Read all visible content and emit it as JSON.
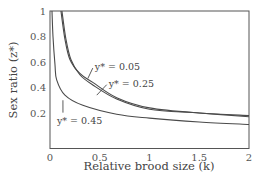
{
  "chart_data": {
    "type": "line",
    "title": "",
    "xlabel": "Relative brood size (k)",
    "ylabel": "Sex ratio (z*)",
    "xlim": [
      0,
      2
    ],
    "ylim": [
      0.07,
      1
    ],
    "xticks": [
      "0",
      "0.5",
      "1",
      "1.5",
      "2"
    ],
    "yticks": [
      "0.2",
      "0.4",
      "0.6",
      "0.8",
      "1"
    ],
    "grid": false,
    "legend": "inline annotations",
    "series": [
      {
        "name": "y* = 0.05",
        "x": [
          0.11,
          0.15,
          0.2,
          0.3,
          0.43,
          0.67,
          1.0,
          1.5,
          2.0
        ],
        "y": [
          1.0,
          0.78,
          0.62,
          0.51,
          0.44,
          0.32,
          0.24,
          0.2,
          0.18
        ]
      },
      {
        "name": "y* = 0.25",
        "x": [
          0.12,
          0.16,
          0.21,
          0.3,
          0.43,
          0.67,
          1.0,
          1.5,
          2.0
        ],
        "y": [
          1.0,
          0.78,
          0.62,
          0.5,
          0.42,
          0.31,
          0.23,
          0.2,
          0.17
        ]
      },
      {
        "name": "y* = 0.45",
        "x": [
          0.02,
          0.03,
          0.05,
          0.067,
          0.15,
          0.33,
          0.67,
          1.0,
          1.5,
          2.0
        ],
        "y": [
          1.0,
          0.8,
          0.58,
          0.46,
          0.34,
          0.26,
          0.19,
          0.16,
          0.13,
          0.11
        ]
      }
    ],
    "annotations": [
      {
        "text": "y* = 0.05",
        "x": 0.45,
        "y": 0.56,
        "leader_to": [
          0.38,
          0.47
        ]
      },
      {
        "text": "y* = 0.25",
        "x": 0.59,
        "y": 0.43,
        "leader_to": [
          0.47,
          0.34
        ]
      },
      {
        "text": "y* = 0.45",
        "x": 0.07,
        "y": 0.14,
        "leader_to": [
          0.13,
          0.3
        ]
      }
    ]
  }
}
